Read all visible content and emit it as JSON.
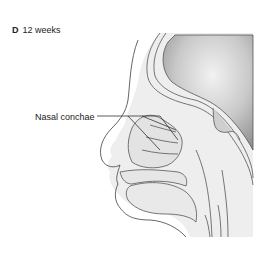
{
  "figure": {
    "panel_letter": "D",
    "stage": "12 weeks",
    "labels": [
      {
        "text": "Nasal conchae",
        "target": "nasal-conchae"
      }
    ],
    "colors": {
      "outline": "#555555",
      "tissue_fill": "#ececec",
      "brain_fill": "#b8b8b8",
      "background": "#ffffff"
    }
  }
}
